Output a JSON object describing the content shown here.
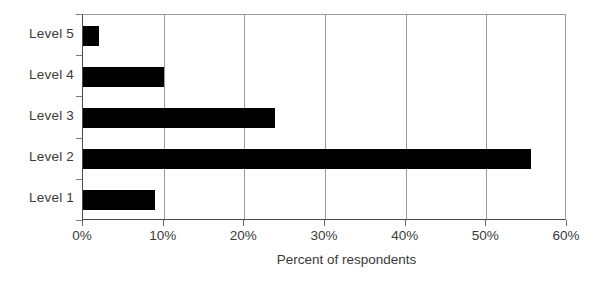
{
  "chart_data": {
    "type": "bar",
    "orientation": "horizontal",
    "title": "",
    "xlabel": "Percent of respondents",
    "ylabel": "",
    "categories": [
      "Level 1",
      "Level 2",
      "Level 3",
      "Level 4",
      "Level 5"
    ],
    "values": [
      8.9,
      55.5,
      23.8,
      10.0,
      2.0
    ],
    "xlim": [
      0,
      60
    ],
    "xticks": [
      0,
      10,
      20,
      30,
      40,
      50,
      60
    ],
    "xtick_labels": [
      "0%",
      "10%",
      "20%",
      "30%",
      "40%",
      "50%",
      "60%"
    ],
    "grid": "vertical",
    "legend": "none",
    "bar_color": "#000000",
    "gridline_color": "#9a9a9a",
    "axis_color": "#4a4a4a",
    "text_color": "#3a3a3a",
    "background": "#ffffff"
  },
  "axis": {
    "x_title": "Percent of respondents"
  }
}
